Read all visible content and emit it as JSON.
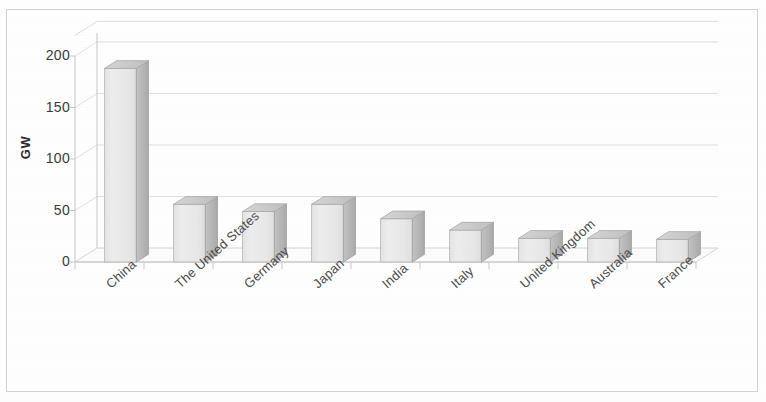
{
  "chart_data": {
    "type": "bar",
    "title": "",
    "subtitle": "",
    "xlabel": "",
    "ylabel": "GW",
    "categories": [
      "China",
      "The United States",
      "Germany",
      "Japan",
      "India",
      "Italy",
      "United Kingdom",
      "Australia",
      "France"
    ],
    "values": [
      188,
      56,
      49,
      56,
      42,
      31,
      23,
      23,
      22
    ],
    "ylim": [
      0,
      220
    ],
    "yticks": [
      0,
      50,
      100,
      150,
      200
    ],
    "ytick_labels": [
      "0",
      "50",
      "100",
      "150",
      "200"
    ],
    "grid": true,
    "grid_axis": "y",
    "legend": false,
    "legend_position": "none",
    "three_d": true,
    "series": [
      {
        "name": "Installed capacity",
        "values": [
          188,
          56,
          49,
          56,
          42,
          31,
          23,
          23,
          22
        ]
      }
    ]
  },
  "style": {
    "bar_front_color": "#e9e9e9",
    "bar_side_color": "#b9b9b9",
    "bar_top_color": "#cccccc",
    "bar_edge_color": "#a8a8a8",
    "grid_color": "#d8d8d8",
    "axis_color": "#bdbdbd",
    "floor_color": "#fbfbfb",
    "text_color": "#3a3a3a",
    "frame_color": "#d2d2d2",
    "background": "#ffffff"
  }
}
